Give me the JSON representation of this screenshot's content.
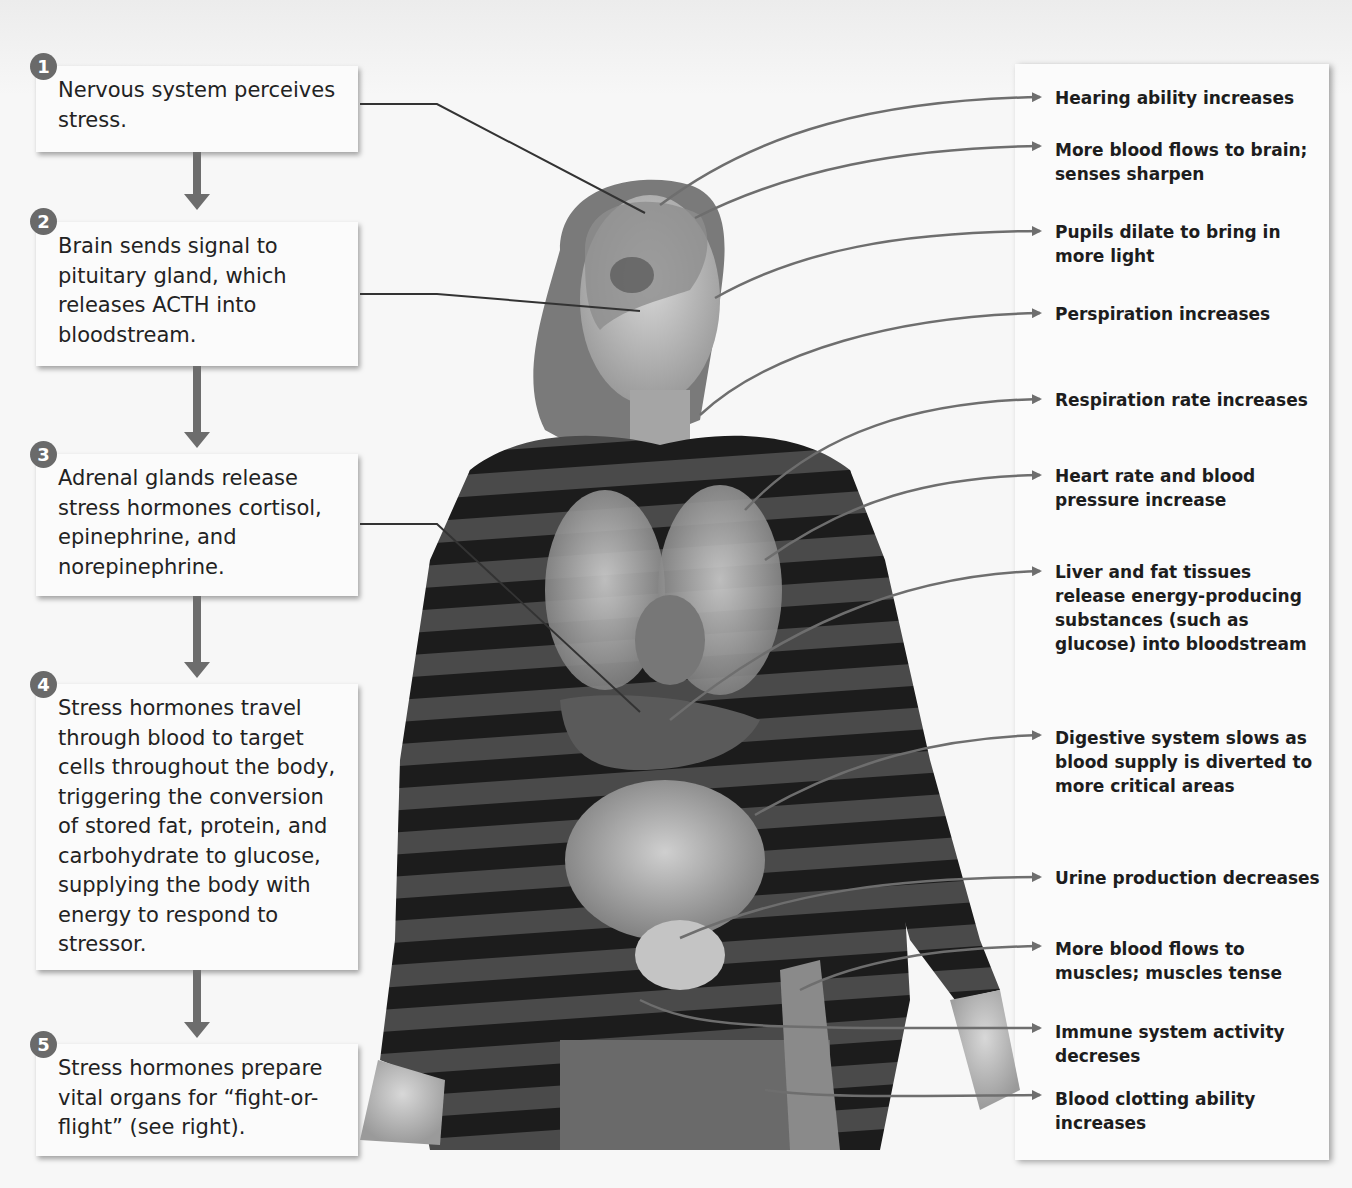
{
  "diagram": {
    "steps": [
      {
        "number": "1",
        "text": "Nervous system perceives stress."
      },
      {
        "number": "2",
        "text": "Brain sends signal to pituitary gland, which releases ACTH into bloodstream."
      },
      {
        "number": "3",
        "text": "Adrenal glands release stress hormones cortisol, epinephrine, and norepinephrine."
      },
      {
        "number": "4",
        "text": "Stress hormones travel through blood to target cells throughout the body, triggering the conversion of stored fat, protein, and carbohydrate to glucose, supplying the body with energy to respond to stressor."
      },
      {
        "number": "5",
        "text": "Stress hormones prepare vital organs for “fight-or-flight” (see right)."
      }
    ],
    "effects": [
      {
        "label": "Hearing ability increases"
      },
      {
        "label": "More blood flows to brain; senses sharpen"
      },
      {
        "label": "Pupils dilate to bring in more light"
      },
      {
        "label": "Perspiration increases"
      },
      {
        "label": "Respiration rate increases"
      },
      {
        "label": "Heart rate and blood pressure increase"
      },
      {
        "label": "Liver and fat tissues release energy-producing substances (such as glucose) into bloodstream"
      },
      {
        "label": "Digestive system slows as blood supply is diverted to more critical areas"
      },
      {
        "label": "Urine production decreases"
      },
      {
        "label": "More blood flows to muscles; muscles tense"
      },
      {
        "label": "Immune system activity decreses"
      },
      {
        "label": "Blood clotting ability increases"
      }
    ],
    "figure": {
      "subject": "woman-with-anatomical-overlay",
      "shirt": "black-gray-striped-long-sleeve"
    },
    "colors": {
      "step_badge": "#6a6a6a",
      "arrow": "#6d6d6d",
      "leader_line": "#333333",
      "effect_arrow": "#6e6e6e",
      "panel": "#fbfbfb"
    }
  }
}
